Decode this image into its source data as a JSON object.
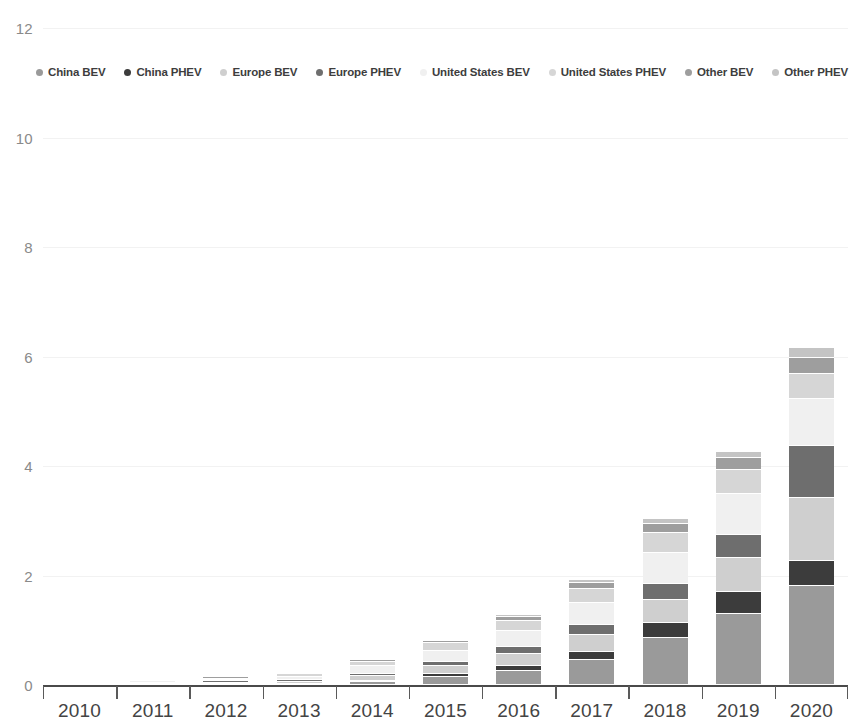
{
  "chart_data": {
    "type": "bar",
    "stacked": true,
    "title": "",
    "subtitle": "",
    "xlabel": "",
    "ylabel": "",
    "ylim": [
      0,
      12
    ],
    "ytick_labels": [
      "0",
      "2",
      "4",
      "6",
      "8",
      "10",
      "12"
    ],
    "ytick_values": [
      0,
      2,
      4,
      6,
      8,
      10,
      12
    ],
    "grid": true,
    "legend_position": "top",
    "categories": [
      "2010",
      "2011",
      "2012",
      "2013",
      "2014",
      "2015",
      "2016",
      "2017",
      "2018",
      "2019",
      "2020"
    ],
    "series": [
      {
        "name": "China BEV",
        "color": "#9a9a9a",
        "values": [
          0.0,
          0.01,
          0.01,
          0.02,
          0.06,
          0.15,
          0.26,
          0.45,
          0.86,
          1.3,
          1.8
        ]
      },
      {
        "name": "China PHEV",
        "color": "#3c3c3c",
        "values": [
          0.0,
          0.0,
          0.0,
          0.0,
          0.02,
          0.05,
          0.09,
          0.16,
          0.28,
          0.4,
          0.47
        ]
      },
      {
        "name": "Europe BEV",
        "color": "#cfcfcf",
        "values": [
          0.0,
          0.01,
          0.02,
          0.04,
          0.08,
          0.14,
          0.21,
          0.3,
          0.42,
          0.62,
          1.15
        ]
      },
      {
        "name": "Europe PHEV",
        "color": "#6e6e6e",
        "values": [
          0.0,
          0.0,
          0.01,
          0.02,
          0.04,
          0.08,
          0.13,
          0.19,
          0.29,
          0.42,
          0.95
        ]
      },
      {
        "name": "United States BEV",
        "color": "#f0f0f0",
        "values": [
          0.0,
          0.01,
          0.03,
          0.07,
          0.14,
          0.21,
          0.29,
          0.4,
          0.57,
          0.75,
          0.85
        ]
      },
      {
        "name": "United States PHEV",
        "color": "#d6d6d6",
        "values": [
          0.0,
          0.01,
          0.02,
          0.04,
          0.08,
          0.13,
          0.19,
          0.26,
          0.36,
          0.43,
          0.47
        ]
      },
      {
        "name": "Other BEV",
        "color": "#9e9e9e",
        "values": [
          0.0,
          0.0,
          0.01,
          0.02,
          0.03,
          0.05,
          0.08,
          0.11,
          0.17,
          0.23,
          0.29
        ]
      },
      {
        "name": "Other PHEV",
        "color": "#c4c4c4",
        "values": [
          0.0,
          0.0,
          0.0,
          0.01,
          0.01,
          0.02,
          0.03,
          0.05,
          0.08,
          0.11,
          0.17
        ]
      }
    ],
    "totals": [
      0.0,
      0.04,
      0.1,
      0.22,
      0.46,
      0.83,
      1.28,
      1.92,
      3.03,
      4.26,
      6.15
    ]
  },
  "legend": {
    "items": [
      {
        "label": "China BEV",
        "marker": "legend-dot-china-bev"
      },
      {
        "label": "China PHEV",
        "marker": "legend-dot-china-phev"
      },
      {
        "label": "Europe BEV",
        "marker": "legend-dot-europe-bev"
      },
      {
        "label": "Europe PHEV",
        "marker": "legend-dot-europe-phev"
      },
      {
        "label": "United States BEV",
        "marker": "legend-dot-united-states-bev"
      },
      {
        "label": "United States PHEV",
        "marker": "legend-dot-united-states-phev"
      },
      {
        "label": "Other BEV",
        "marker": "legend-dot-other-bev"
      },
      {
        "label": "Other PHEV",
        "marker": "legend-dot-other-phev"
      }
    ]
  },
  "colors": {
    "grid": "#f2f2f2",
    "axis": "#4a4a4a",
    "ytick_text": "#8a8a8a",
    "xtick_text": "#444444",
    "legend_text": "#3d3d3d",
    "background": "#ffffff"
  }
}
